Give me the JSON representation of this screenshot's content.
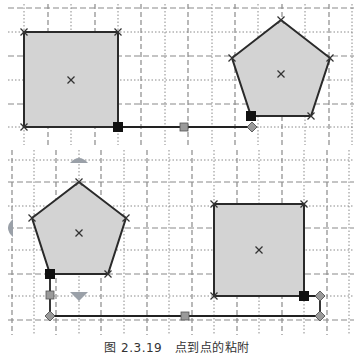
{
  "caption": "图 2.3.19　点到点的粘附",
  "colors": {
    "shape_fill": "#d3d3d3",
    "shape_stroke": "#2a2a2a",
    "grid_line": "#8a8a8a",
    "connector": "#222222",
    "endpoint_marker": "#111111",
    "handle_fill": "#9a9a9a",
    "arrow_hint": "#9aa0a8",
    "background": "#ffffff"
  },
  "panels": [
    {
      "name": "top-panel",
      "shapes": [
        {
          "type": "square",
          "center": [
            71,
            80
          ]
        },
        {
          "type": "pentagon",
          "center": [
            281,
            74
          ]
        }
      ],
      "connector": {
        "style": "straight",
        "from": "square-bottom-right",
        "to": "pentagon-bottom-left"
      }
    },
    {
      "name": "bottom-panel",
      "shapes": [
        {
          "type": "pentagon",
          "center": [
            79,
            233
          ]
        },
        {
          "type": "square",
          "center": [
            259,
            250
          ]
        }
      ],
      "connector": {
        "style": "elbow",
        "from": "pentagon-bottom-left",
        "to": "square-bottom-right"
      },
      "arrow_hints": [
        "up",
        "left",
        "down"
      ]
    }
  ]
}
